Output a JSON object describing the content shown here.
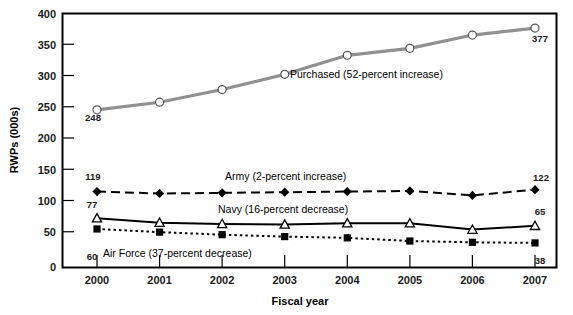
{
  "chart_data": {
    "type": "line",
    "title": "",
    "xlabel": "Fiscal year",
    "ylabel": "RWPs (000s)",
    "categories": [
      "2000",
      "2001",
      "2002",
      "2003",
      "2004",
      "2005",
      "2006",
      "2007"
    ],
    "x": [
      2000,
      2001,
      2002,
      2003,
      2004,
      2005,
      2006,
      2007
    ],
    "ylim": [
      0,
      400
    ],
    "yticks": [
      "0",
      "50",
      "100",
      "150",
      "200",
      "250",
      "300",
      "350",
      "400"
    ],
    "ytick_values": [
      0,
      50,
      100,
      150,
      200,
      250,
      300,
      350,
      400
    ],
    "grid": false,
    "legend": "inline-annotations",
    "series": [
      {
        "name": "Purchased",
        "annotation": "Purchased (52-percent increase)",
        "marker": "open-circle",
        "line_style": "solid",
        "color": "#909090",
        "values": [
          248,
          260,
          280,
          304,
          334,
          345,
          366,
          377
        ],
        "first_label": "248",
        "last_label": "377"
      },
      {
        "name": "Army",
        "annotation": "Army (2-percent increase)",
        "marker": "filled-diamond",
        "line_style": "dashed",
        "color": "#000000",
        "values": [
          119,
          116,
          117,
          118,
          119,
          120,
          113,
          122
        ],
        "first_label": "119",
        "last_label": "122"
      },
      {
        "name": "Navy",
        "annotation": "Navy (16-percent decrease)",
        "marker": "open-triangle",
        "line_style": "solid",
        "color": "#000000",
        "values": [
          77,
          70,
          68,
          67,
          69,
          69,
          59,
          65
        ],
        "first_label": "77",
        "last_label": "65"
      },
      {
        "name": "Air Force",
        "annotation": "Air Force (37-percent decrease)",
        "marker": "filled-square",
        "line_style": "dotted",
        "color": "#000000",
        "values": [
          60,
          55,
          51,
          48,
          46,
          41,
          39,
          38
        ],
        "first_label": "60",
        "last_label": "38"
      }
    ]
  },
  "axes": {
    "x_title": "Fiscal year",
    "y_title": "RWPs (000s)"
  },
  "annotations": {
    "purchased": "Purchased (52-percent increase)",
    "army": "Army (2-percent increase)",
    "navy": "Navy (16-percent decrease)",
    "airforce": "Air Force (37-percent decrease)"
  },
  "value_labels": {
    "purchased_start": "248",
    "purchased_end": "377",
    "army_start": "119",
    "army_end": "122",
    "navy_start": "77",
    "navy_end": "65",
    "airforce_start": "60",
    "airforce_end": "38"
  },
  "ytick_labels": {
    "t0": "0",
    "t50": "50",
    "t100": "100",
    "t150": "150",
    "t200": "200",
    "t250": "250",
    "t300": "300",
    "t350": "350",
    "t400": "400"
  },
  "xtick_labels": {
    "y2000": "2000",
    "y2001": "2001",
    "y2002": "2002",
    "y2003": "2003",
    "y2004": "2004",
    "y2005": "2005",
    "y2006": "2006",
    "y2007": "2007"
  }
}
